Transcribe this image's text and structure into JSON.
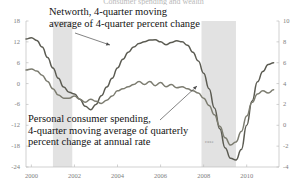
{
  "chart": {
    "title": "Consumer spending and wealth",
    "annotations": [
      {
        "id": "networth",
        "line1": "Networth, 4-quarter moving",
        "line2": "average of 4-quarter percent change"
      },
      {
        "id": "spending",
        "line1": "Personal consumer spending,",
        "line2": "4-quarter moving average of quarterly",
        "line3": "percent change at annual rate"
      }
    ],
    "inline_label": "case",
    "y_left_ticks": [
      "18",
      "12",
      "6",
      "0",
      "-6",
      "-12",
      "-18",
      "-24"
    ],
    "y_right_ticks": [
      "10",
      "8",
      "6",
      "4",
      "2",
      "0",
      "-2",
      "-4"
    ],
    "x_ticks": [
      "2000",
      "2002",
      "2004",
      "2006",
      "2008",
      "2010"
    ],
    "colors": {
      "series_networth": "#5b5b52",
      "series_spending": "#7c7c70",
      "recession_band": "#e2e2e2",
      "axis": "#bdbdbd",
      "tick_text": "#7e7e7e"
    }
  },
  "chart_data": {
    "type": "line",
    "title": "Consumer spending and wealth",
    "xlabel": "",
    "ylabel": "",
    "grid": false,
    "legend": "annotated-inline",
    "xlim": [
      1999.75,
      2011.5
    ],
    "ylim_left": [
      -24,
      18
    ],
    "ylim_right": [
      -4,
      10
    ],
    "recession_bands": [
      {
        "start": 2001.0,
        "end": 2001.9
      },
      {
        "start": 2007.9,
        "end": 2009.5
      }
    ],
    "series": [
      {
        "name": "Networth, 4-quarter moving average of 4-quarter percent change",
        "axis": "left",
        "color": "#5b5b52",
        "x": [
          1999.75,
          2000.0,
          2000.25,
          2000.5,
          2000.75,
          2001.0,
          2001.25,
          2001.5,
          2001.75,
          2002.0,
          2002.25,
          2002.5,
          2002.75,
          2003.0,
          2003.25,
          2003.5,
          2003.75,
          2004.0,
          2004.25,
          2004.5,
          2004.75,
          2005.0,
          2005.25,
          2005.5,
          2005.75,
          2006.0,
          2006.25,
          2006.5,
          2006.75,
          2007.0,
          2007.25,
          2007.5,
          2007.75,
          2008.0,
          2008.25,
          2008.5,
          2008.75,
          2009.0,
          2009.25,
          2009.5,
          2009.75,
          2010.0,
          2010.25,
          2010.5,
          2010.75,
          2011.0,
          2011.25
        ],
        "y": [
          12.8,
          13.2,
          12.4,
          10.5,
          7.5,
          4.5,
          1.5,
          -1.0,
          -2.5,
          -3.0,
          -4.5,
          -6.5,
          -7.5,
          -6.0,
          -3.5,
          -1.0,
          1.5,
          4.5,
          7.0,
          9.0,
          10.5,
          11.5,
          12.0,
          12.5,
          12.6,
          12.0,
          11.2,
          11.8,
          12.3,
          12.0,
          11.0,
          9.0,
          6.5,
          3.0,
          -1.5,
          -7.0,
          -13.0,
          -18.5,
          -21.5,
          -22.0,
          -19.0,
          -12.0,
          -5.0,
          0.5,
          3.5,
          5.5,
          6.0
        ]
      },
      {
        "name": "Personal consumer spending, 4-quarter moving average of quarterly percent change at annual rate",
        "axis": "right",
        "color": "#7c7c70",
        "x": [
          1999.75,
          2000.0,
          2000.25,
          2000.5,
          2000.75,
          2001.0,
          2001.25,
          2001.5,
          2001.75,
          2002.0,
          2002.25,
          2002.5,
          2002.75,
          2003.0,
          2003.25,
          2003.5,
          2003.75,
          2004.0,
          2004.25,
          2004.5,
          2004.75,
          2005.0,
          2005.25,
          2005.5,
          2005.75,
          2006.0,
          2006.25,
          2006.5,
          2006.75,
          2007.0,
          2007.25,
          2007.5,
          2007.75,
          2008.0,
          2008.25,
          2008.5,
          2008.75,
          2009.0,
          2009.25,
          2009.5,
          2009.75,
          2010.0,
          2010.25,
          2010.5,
          2010.75,
          2011.0,
          2011.25
        ],
        "y": [
          5.3,
          5.4,
          5.2,
          4.8,
          4.2,
          3.5,
          2.9,
          2.6,
          2.6,
          2.8,
          2.5,
          2.2,
          2.5,
          2.3,
          2.1,
          2.4,
          2.8,
          3.3,
          3.5,
          3.7,
          3.9,
          4.2,
          3.9,
          4.2,
          3.8,
          4.1,
          3.7,
          3.9,
          3.6,
          3.7,
          3.5,
          3.3,
          3.1,
          2.6,
          1.9,
          1.0,
          -0.1,
          -1.2,
          -1.9,
          -1.6,
          -0.6,
          0.9,
          2.2,
          3.0,
          3.3,
          3.1,
          3.4
        ]
      }
    ]
  }
}
